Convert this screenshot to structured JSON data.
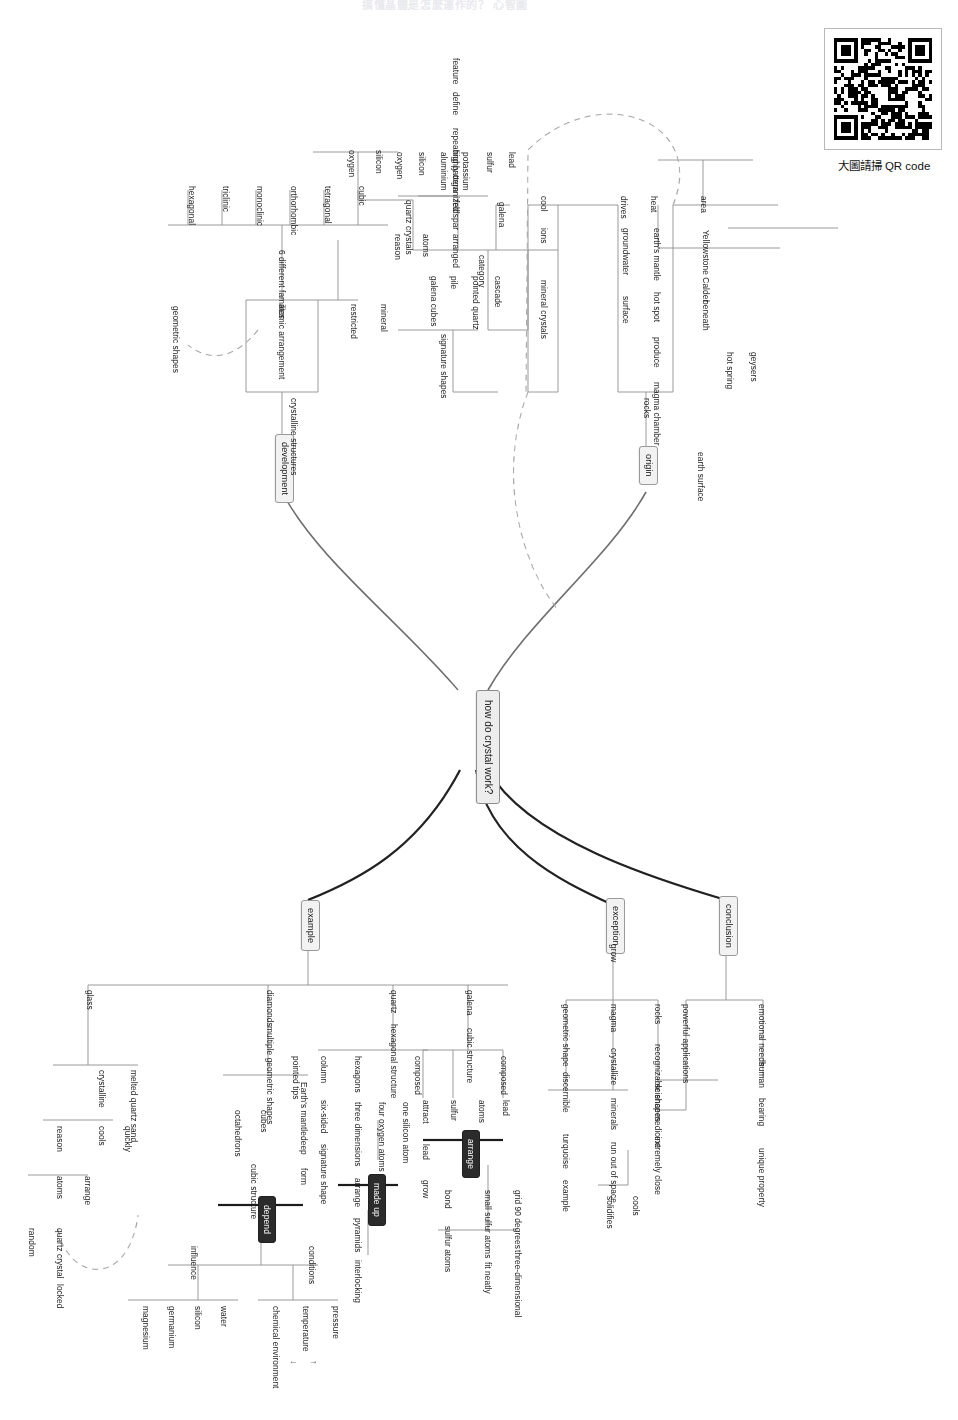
{
  "page": {
    "title_strip": "搞懂晶體是怎麼運作的？ 心智圖",
    "qr": {
      "caption": "大圖請掃 QR code",
      "frame_label": "qr-code"
    }
  },
  "root": {
    "label": "how do crystal work?"
  },
  "branches": [
    {
      "id": "origin",
      "label": "origin"
    },
    {
      "id": "development",
      "label": "development"
    },
    {
      "id": "conclusion",
      "label": "conclusion"
    },
    {
      "id": "exception",
      "label": "exception"
    },
    {
      "id": "example",
      "label": "example"
    }
  ],
  "origin": {
    "stem": "rocks",
    "chains": [
      {
        "id": "area",
        "items": [
          "area",
          "Yellowstone Calder",
          "beneath",
          "geysers",
          "hot spring"
        ]
      },
      {
        "id": "heat",
        "items": [
          "heat",
          "earth's mantle",
          "hot spot",
          "produce",
          "magma chamber",
          "earth surface"
        ]
      },
      {
        "id": "drives",
        "items": [
          "drives",
          "groundwater",
          "surface"
        ]
      },
      {
        "id": "cool",
        "items": [
          "cool",
          "ions",
          "mineral crystals"
        ]
      }
    ],
    "category": {
      "label": "category",
      "groups": [
        {
          "name": "quartz crystals",
          "members": [
            "silicon",
            "oxygen"
          ]
        },
        {
          "name": "feldspar",
          "members": [
            "potassium",
            "aluminium",
            "silicon",
            "oxygen"
          ]
        },
        {
          "name": "galena",
          "members": [
            "lead",
            "sulfur"
          ]
        }
      ]
    },
    "signature_shapes": {
      "label": "signature shapes",
      "rows": [
        [
          "pointed quartz",
          "cascade"
        ],
        [
          "galena cubes",
          "pile"
        ],
        [
          "reason",
          "atoms",
          "arranged"
        ]
      ],
      "arranged_detail": {
        "top": "highly organized",
        "pattern": "repeating pattern",
        "tail": [
          "define",
          "feature"
        ]
      }
    }
  },
  "development": {
    "stem": "crystalline structures",
    "restricted": [
      "restricted",
      "mineral"
    ],
    "atomic": {
      "label": "atomic arrangement",
      "families_label": "6 different families",
      "families": [
        "cubic",
        "tetragonal",
        "orthorhombic",
        "monoclinic",
        "triclinic",
        "hexagonal"
      ],
      "linked_to": "geometric shapes"
    }
  },
  "conclusion": {
    "chain": [
      "emotional needs",
      "human",
      "bearing",
      "unique property"
    ],
    "applications": {
      "label": "powerful applications",
      "members": [
        "science",
        "medicine"
      ]
    }
  },
  "exception": {
    "stem": "grow",
    "rows": [
      [
        "rocks",
        "recognizable shapes",
        "extremely close"
      ],
      [
        "magma",
        "crystallize",
        "minerals",
        "run out of space"
      ],
      [
        "geometric shape",
        "discernible",
        "turquoise",
        "example"
      ]
    ],
    "cools": {
      "label": "cools",
      "child": "solidifies"
    }
  },
  "example": {
    "galena": {
      "head": [
        "galena",
        "cubic structure"
      ],
      "composed_label": "composed",
      "rows": [
        [
          "lead",
          "atoms"
        ],
        [
          "sulfur"
        ],
        [
          "attract",
          "lead",
          "grow"
        ]
      ],
      "emphasis": "arrange",
      "detail_rows": [
        [
          "grid 90 degrees",
          "three-dimensional"
        ],
        [
          "small sulfur atoms",
          "fit neatly"
        ],
        [
          "bond",
          "sulfur atoms"
        ]
      ]
    },
    "quartz": {
      "head": [
        "quartz",
        "hexagonal structure"
      ],
      "composed_label": "composed",
      "rows": [
        [
          "hexagons",
          "three dimensions",
          "arrange"
        ],
        [
          "one silicon atom"
        ],
        [
          "four oxygen atoms"
        ],
        [
          "column",
          "six-sided",
          "signature shape"
        ],
        [
          "pointed tips"
        ]
      ],
      "emphasis": "made up",
      "detail": [
        "pyramids",
        "interlocking"
      ]
    },
    "diamonds": {
      "head": [
        "diamonds",
        "multiple geometric shapes"
      ],
      "rows": [
        [
          "Earth's mantle",
          "deep",
          "form"
        ],
        [
          "cubes"
        ],
        [
          "octahedrons",
          "cubic structure"
        ]
      ],
      "emphasis": "depend",
      "conditions": {
        "label": "conditions",
        "members": [
          "pressure",
          "temperature",
          "chemical environment"
        ],
        "temperature_arrows": [
          "↑",
          "↓"
        ]
      },
      "influence": {
        "label": "influence",
        "members": [
          "water",
          "silicon",
          "germanium",
          "magnesium"
        ]
      }
    },
    "glass": {
      "head": "glass",
      "rows": [
        [
          "melted quartz sand"
        ],
        [
          "crystalline"
        ],
        [
          "cools",
          "quickly"
        ],
        [
          "reason",
          "atoms",
          "arrange"
        ],
        [
          "quartz crystal",
          "locked"
        ],
        [
          "random"
        ]
      ]
    }
  },
  "colors": {
    "wire": "#8f8f8f",
    "wire_strong": "#6e6e6e",
    "wire_dark": "#1c1c1c",
    "dashed": "#a9a9a9",
    "box_fill": "#f2f2f2",
    "dark_fill": "#2b2b2b"
  }
}
